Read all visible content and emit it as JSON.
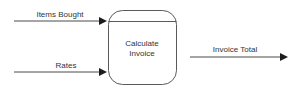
{
  "diagram": {
    "type": "data-flow-diagram",
    "width": 297,
    "height": 100,
    "background_color": "#ffffff",
    "stroke_color": "#4a4a4a",
    "text_color": "#333333",
    "process": {
      "name": "calculate-invoice-process",
      "label_line1": "Calculate",
      "label_line2": "Invoice",
      "shape": "rounded-rectangle-with-top-band",
      "x": 108,
      "y": 10,
      "width": 69,
      "height": 75,
      "corner_radius": 14,
      "divider_y": 21
    },
    "flows": [
      {
        "name": "items-bought-flow",
        "label": "Items Bought",
        "direction": "input",
        "x1": 14,
        "y1": 21,
        "x2": 106,
        "y2": 21,
        "label_x": 60,
        "label_y": 17
      },
      {
        "name": "rates-flow",
        "label": "Rates",
        "direction": "input",
        "x1": 14,
        "y1": 72,
        "x2": 106,
        "y2": 72,
        "label_x": 66,
        "label_y": 68
      },
      {
        "name": "invoice-total-flow",
        "label": "Invoice Total",
        "direction": "output",
        "x1": 190,
        "y1": 57,
        "x2": 288,
        "y2": 57,
        "label_x": 235,
        "label_y": 52
      }
    ]
  }
}
